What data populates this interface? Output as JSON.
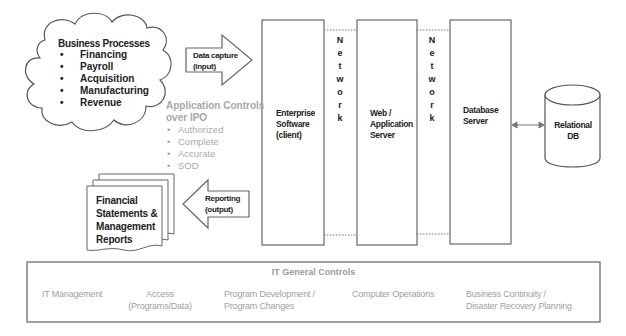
{
  "business_processes": {
    "title": "Business Processes",
    "items": [
      "Financing",
      "Payroll",
      "Acquisition",
      "Manufacturing",
      "Revenue"
    ]
  },
  "input_arrow": {
    "line1": "Data capture",
    "line2": "(input)"
  },
  "output_arrow": {
    "line1": "Reporting",
    "line2": "(output)"
  },
  "application_controls": {
    "title_line1": "Application Controls",
    "title_line2": "over IPO",
    "items": [
      "Authorized",
      "Complete",
      "Accurate",
      "SOD"
    ]
  },
  "reports": {
    "lines": [
      "Financial",
      "Statements &",
      "Management",
      "Reports"
    ]
  },
  "tiers": [
    {
      "lines": [
        "Enterprise",
        "Software",
        "(client)"
      ]
    },
    {
      "lines": [
        "Web /",
        "Application",
        "Server"
      ]
    },
    {
      "lines": [
        "Database",
        "Server"
      ]
    }
  ],
  "network_label": [
    "N",
    "e",
    "t",
    "w",
    "o",
    "r",
    "k"
  ],
  "database": {
    "lines": [
      "Relational",
      "DB"
    ]
  },
  "it_general_controls": {
    "title": "IT General Controls",
    "items": [
      {
        "line1": "IT Management",
        "line2": ""
      },
      {
        "line1": "Access",
        "line2": "(Programs/Data)"
      },
      {
        "line1": "Program Development /",
        "line2": "Program Changes"
      },
      {
        "line1": "Computer Operations",
        "line2": ""
      },
      {
        "line1": "Business Continuity /",
        "line2": "Disaster Recovery Planning"
      }
    ]
  },
  "colors": {
    "stroke": "#6b6b6b",
    "muted_text": "#a8a8a8",
    "text": "#222222"
  }
}
